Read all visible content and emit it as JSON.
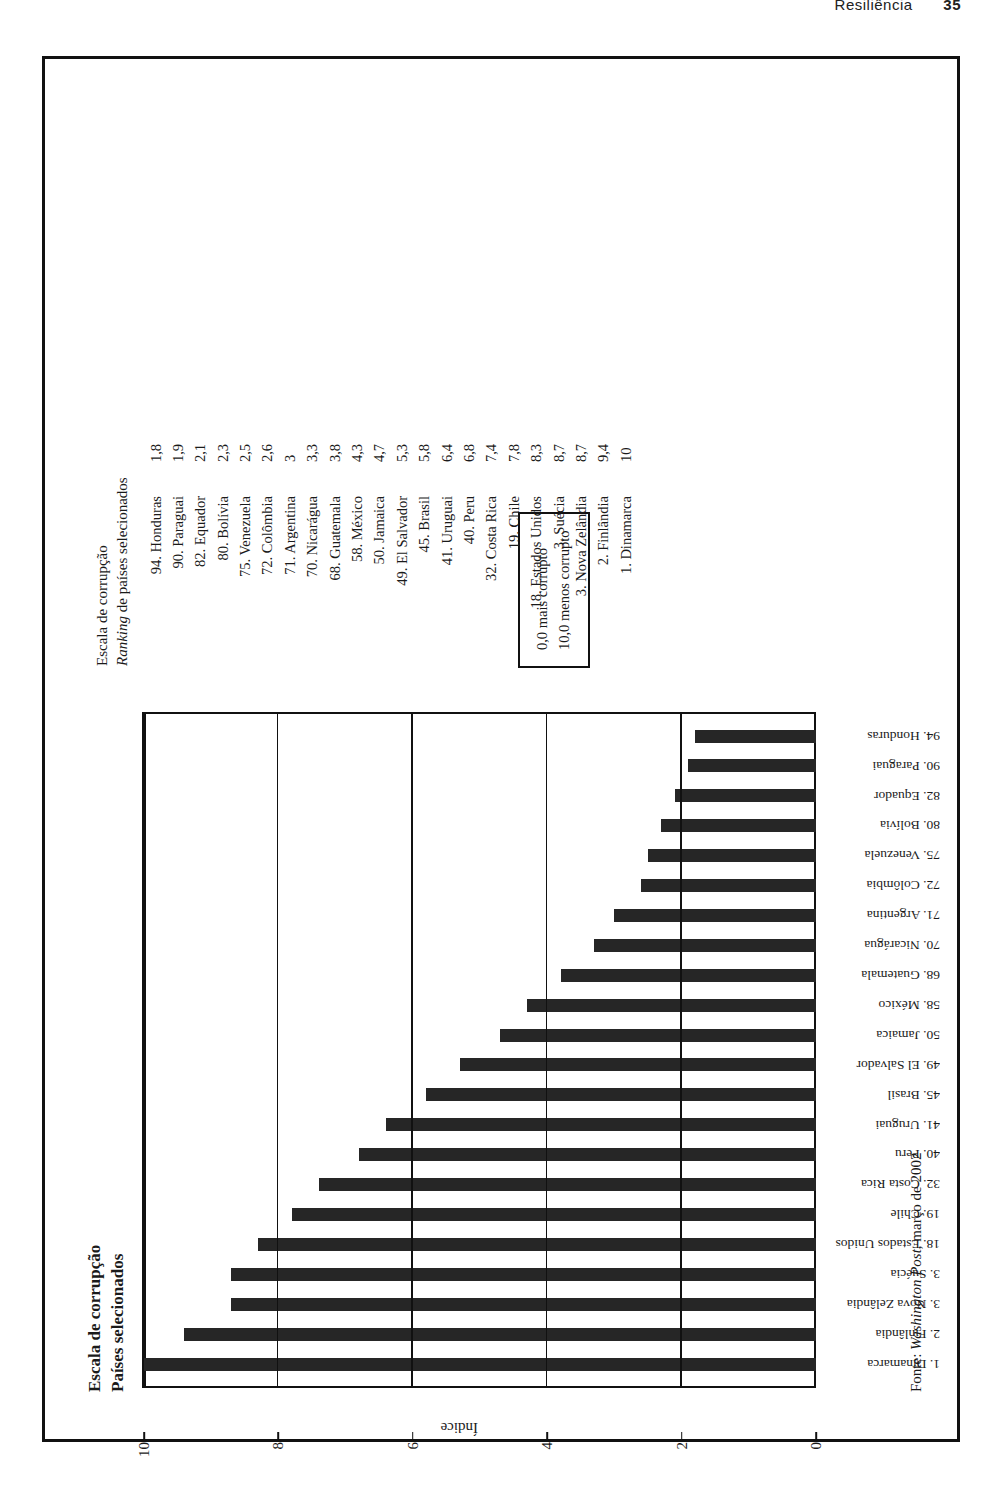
{
  "page": {
    "running_head": "Resiliência",
    "page_number": "35"
  },
  "chart_title": {
    "line1": "Escala de corrupção",
    "line2": "Países selecionados"
  },
  "ranking_panel": {
    "header_line1": "Escala de corrupção",
    "header_line2_italic": "Ranking",
    "header_line2_rest": " de países selecionados"
  },
  "note_box": {
    "line1": "0,0 mais corrupto",
    "line2": "10,0 menos corrupto"
  },
  "source": {
    "prefix": "Fonte: ",
    "italic": "Washington Post",
    "suffix": ", março de 2002"
  },
  "chart_data": {
    "type": "bar",
    "xlabel": "",
    "ylabel": "Índice",
    "ylim": [
      0,
      10
    ],
    "yticks": [
      "0",
      "2",
      "4",
      "6",
      "8",
      "10"
    ],
    "grid": true,
    "legend": "none",
    "categories": [
      "1. Dinamarca",
      "2. Finlândia",
      "3. Nova Zelândia",
      "3. Suécia",
      "18. Estados Unidos",
      "19. Chile",
      "32. Costa Rica",
      "40. Peru",
      "41. Uruguai",
      "45. Brasil",
      "49. El Salvador",
      "50. Jamaica",
      "58. México",
      "68. Guatemala",
      "70. Nicarágua",
      "71. Argentina",
      "72. Colômbia",
      "75. Venezuela",
      "80. Bolívia",
      "82. Equador",
      "90. Paraguai",
      "94. Honduras"
    ],
    "values": [
      10,
      9.4,
      8.7,
      8.7,
      8.3,
      7.8,
      7.4,
      6.8,
      6.4,
      5.8,
      5.3,
      4.7,
      4.3,
      3.8,
      3.3,
      3,
      2.6,
      2.5,
      2.3,
      2.1,
      1.9,
      1.8
    ]
  },
  "ranking_rows": [
    {
      "name": "94. Honduras",
      "value": "1,8"
    },
    {
      "name": "90. Paraguai",
      "value": "1,9"
    },
    {
      "name": "82. Equador",
      "value": "2,1"
    },
    {
      "name": "80. Bolívia",
      "value": "2,3"
    },
    {
      "name": "75. Venezuela",
      "value": "2,5"
    },
    {
      "name": "72. Colômbia",
      "value": "2,6"
    },
    {
      "name": "71. Argentina",
      "value": "3"
    },
    {
      "name": "70. Nicarágua",
      "value": "3,3"
    },
    {
      "name": "68. Guatemala",
      "value": "3,8"
    },
    {
      "name": "58. México",
      "value": "4,3"
    },
    {
      "name": "50. Jamaica",
      "value": "4,7"
    },
    {
      "name": "49. El Salvador",
      "value": "5,3"
    },
    {
      "name": "45. Brasil",
      "value": "5,8"
    },
    {
      "name": "41. Uruguai",
      "value": "6,4"
    },
    {
      "name": "40. Peru",
      "value": "6,8"
    },
    {
      "name": "32. Costa Rica",
      "value": "7,4"
    },
    {
      "name": "19. Chile",
      "value": "7,8"
    },
    {
      "name": "18. Estados Unidos",
      "value": "8,3"
    },
    {
      "name": "3. Suécia",
      "value": "8,7"
    },
    {
      "name": "3. Nova Zelândia",
      "value": "8,7"
    },
    {
      "name": "2. Finlândia",
      "value": "9,4"
    },
    {
      "name": "1. Dinamarca",
      "value": "10"
    }
  ]
}
